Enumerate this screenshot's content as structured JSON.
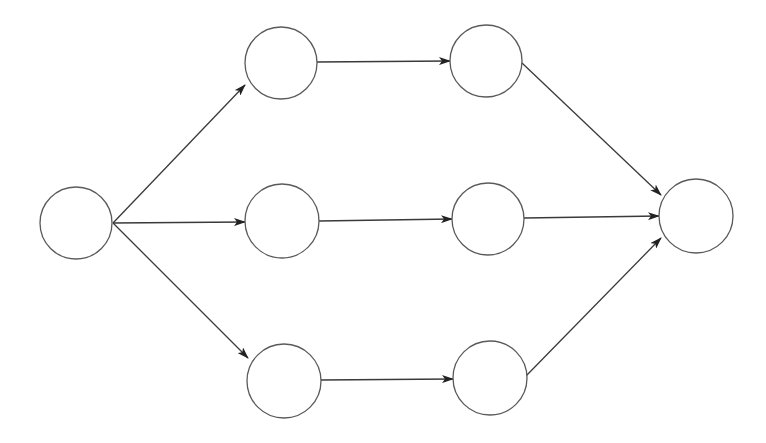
{
  "diagram": {
    "type": "directed-graph",
    "layout": "layered-left-to-right",
    "colors": {
      "background": "#ffffff",
      "node_stroke": "#5a5a5a",
      "node_fill": "#ffffff",
      "edge_stroke": "#3a3a3a",
      "arrowhead": "#222222"
    },
    "nodes": [
      {
        "id": "source",
        "label": "",
        "cx": 76,
        "cy": 223,
        "r": 36
      },
      {
        "id": "top-1",
        "label": "",
        "cx": 281,
        "cy": 63,
        "r": 36
      },
      {
        "id": "top-2",
        "label": "",
        "cx": 486,
        "cy": 61,
        "r": 36
      },
      {
        "id": "mid-1",
        "label": "",
        "cx": 282,
        "cy": 221,
        "r": 37
      },
      {
        "id": "mid-2",
        "label": "",
        "cx": 488,
        "cy": 219,
        "r": 36
      },
      {
        "id": "bot-1",
        "label": "",
        "cx": 284,
        "cy": 381,
        "r": 37
      },
      {
        "id": "bot-2",
        "label": "",
        "cx": 490,
        "cy": 378,
        "r": 37
      },
      {
        "id": "sink",
        "label": "",
        "cx": 696,
        "cy": 216,
        "r": 37
      }
    ],
    "edges": [
      {
        "from": "source",
        "to": "top-1",
        "x1": 113,
        "y1": 223,
        "x2": 245,
        "y2": 85
      },
      {
        "from": "source",
        "to": "mid-1",
        "x1": 113,
        "y1": 223,
        "x2": 245,
        "y2": 222
      },
      {
        "from": "source",
        "to": "bot-1",
        "x1": 113,
        "y1": 223,
        "x2": 248,
        "y2": 358
      },
      {
        "from": "top-1",
        "to": "top-2",
        "x1": 317,
        "y1": 62,
        "x2": 450,
        "y2": 61
      },
      {
        "from": "mid-1",
        "to": "mid-2",
        "x1": 319,
        "y1": 221,
        "x2": 452,
        "y2": 219
      },
      {
        "from": "bot-1",
        "to": "bot-2",
        "x1": 321,
        "y1": 380,
        "x2": 453,
        "y2": 379
      },
      {
        "from": "top-2",
        "to": "sink",
        "x1": 522,
        "y1": 63,
        "x2": 661,
        "y2": 195
      },
      {
        "from": "mid-2",
        "to": "sink",
        "x1": 524,
        "y1": 218,
        "x2": 659,
        "y2": 216
      },
      {
        "from": "bot-2",
        "to": "sink",
        "x1": 526,
        "y1": 376,
        "x2": 661,
        "y2": 238
      }
    ]
  }
}
